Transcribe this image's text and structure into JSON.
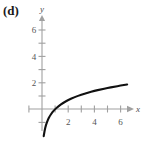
{
  "figure": {
    "panel_label": "(d)",
    "background_color": "#ffffff",
    "axis_color": "#a0a0a0",
    "curve_color": "#111111"
  },
  "chart_data": {
    "type": "line",
    "title": "(d)",
    "xlabel": "x",
    "ylabel": "y",
    "xlim": [
      -1,
      7
    ],
    "ylim": [
      -2,
      7
    ],
    "grid": false,
    "legend": null,
    "x_ticks": [
      1,
      2,
      3,
      4,
      5,
      6
    ],
    "x_tick_labels": [
      "",
      "2",
      "",
      "4",
      "",
      "6"
    ],
    "x_labeled_ticks": [
      2,
      4,
      6
    ],
    "y_ticks": [
      1,
      2,
      3,
      4,
      5,
      6
    ],
    "y_tick_labels": [
      "",
      "2",
      "",
      "4",
      "",
      "6"
    ],
    "y_labeled_ticks": [
      2,
      4,
      6
    ],
    "series": [
      {
        "name": "y = ln x",
        "x": [
          0.13,
          0.2,
          0.3,
          0.45,
          0.6,
          0.8,
          1.0,
          1.3,
          1.6,
          2.0,
          2.5,
          3.0,
          3.5,
          4.0,
          4.5,
          5.0,
          5.5,
          6.0,
          6.5
        ],
        "values": [
          -2.04,
          -1.61,
          -1.2,
          -0.8,
          -0.51,
          -0.22,
          0.0,
          0.26,
          0.47,
          0.69,
          0.92,
          1.1,
          1.25,
          1.39,
          1.5,
          1.61,
          1.7,
          1.79,
          1.87
        ]
      }
    ]
  }
}
